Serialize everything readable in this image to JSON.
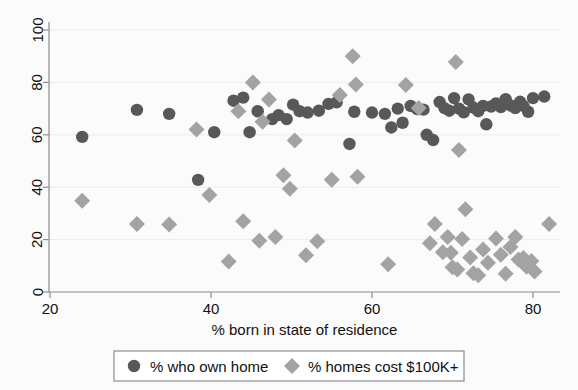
{
  "chart_data": {
    "type": "scatter",
    "title": "",
    "subtitle": "",
    "xlabel": "% born in state of residence",
    "ylabel": "",
    "xlim": [
      20,
      82
    ],
    "ylim": [
      0,
      105
    ],
    "xticks": [
      20,
      40,
      60,
      80
    ],
    "yticks": [
      0,
      20,
      40,
      60,
      80,
      100
    ],
    "xtick_labels": [
      "20",
      "40",
      "60",
      "80"
    ],
    "ytick_labels": [
      "0",
      "20",
      "40",
      "60",
      "80",
      "100"
    ],
    "grid": "horizontal-light",
    "legend_position": "bottom-outside",
    "colors": {
      "own_home": "#585858",
      "homes_100k": "#a3a3a3",
      "axis": "#8c8c8c",
      "grid": "#ececec",
      "background": "#fbfbfb",
      "text": "#111111"
    },
    "series": [
      {
        "name": "% who own home",
        "marker": "circle",
        "color": "#585858",
        "points": [
          [
            24.0,
            59.2
          ],
          [
            30.8,
            69.5
          ],
          [
            34.8,
            68.0
          ],
          [
            38.4,
            42.8
          ],
          [
            40.4,
            61.0
          ],
          [
            42.8,
            73.0
          ],
          [
            44.0,
            74.2
          ],
          [
            44.8,
            61.0
          ],
          [
            45.8,
            69.0
          ],
          [
            47.6,
            66.0
          ],
          [
            48.4,
            67.5
          ],
          [
            49.4,
            66.0
          ],
          [
            50.2,
            71.5
          ],
          [
            51.0,
            69.0
          ],
          [
            52.0,
            68.5
          ],
          [
            53.4,
            69.2
          ],
          [
            54.6,
            71.8
          ],
          [
            55.6,
            72.4
          ],
          [
            57.2,
            56.5
          ],
          [
            57.8,
            68.8
          ],
          [
            60.0,
            68.5
          ],
          [
            61.6,
            68.0
          ],
          [
            62.4,
            62.8
          ],
          [
            63.2,
            70.0
          ],
          [
            63.8,
            64.6
          ],
          [
            64.8,
            71.0
          ],
          [
            65.6,
            69.8
          ],
          [
            66.4,
            69.6
          ],
          [
            66.8,
            60.0
          ],
          [
            67.6,
            58.0
          ],
          [
            68.4,
            72.5
          ],
          [
            69.0,
            70.2
          ],
          [
            69.6,
            69.2
          ],
          [
            70.2,
            74.0
          ],
          [
            70.8,
            70.0
          ],
          [
            71.4,
            68.6
          ],
          [
            72.0,
            73.5
          ],
          [
            72.6,
            70.4
          ],
          [
            73.2,
            69.0
          ],
          [
            73.8,
            71.0
          ],
          [
            74.2,
            64.0
          ],
          [
            74.8,
            70.8
          ],
          [
            75.4,
            72.0
          ],
          [
            76.0,
            70.6
          ],
          [
            76.6,
            73.6
          ],
          [
            77.2,
            71.2
          ],
          [
            77.8,
            70.2
          ],
          [
            78.4,
            72.6
          ],
          [
            78.8,
            71.0
          ],
          [
            79.4,
            68.8
          ],
          [
            80.0,
            74.0
          ],
          [
            81.4,
            74.6
          ]
        ]
      },
      {
        "name": "% homes cost $100K+",
        "marker": "diamond",
        "color": "#a3a3a3",
        "points": [
          [
            24.0,
            34.8
          ],
          [
            30.8,
            26.0
          ],
          [
            34.8,
            25.8
          ],
          [
            38.2,
            62.0
          ],
          [
            39.8,
            37.0
          ],
          [
            42.2,
            11.6
          ],
          [
            43.4,
            69.0
          ],
          [
            44.0,
            27.0
          ],
          [
            45.2,
            80.0
          ],
          [
            46.0,
            19.6
          ],
          [
            46.4,
            65.0
          ],
          [
            47.2,
            73.5
          ],
          [
            48.0,
            21.0
          ],
          [
            49.0,
            44.6
          ],
          [
            49.8,
            39.4
          ],
          [
            50.4,
            57.8
          ],
          [
            51.8,
            14.0
          ],
          [
            53.2,
            19.4
          ],
          [
            55.0,
            42.8
          ],
          [
            56.0,
            75.2
          ],
          [
            57.6,
            90.0
          ],
          [
            58.0,
            79.2
          ],
          [
            58.2,
            44.0
          ],
          [
            62.0,
            10.6
          ],
          [
            64.2,
            79.0
          ],
          [
            65.8,
            70.2
          ],
          [
            67.2,
            18.6
          ],
          [
            67.8,
            26.0
          ],
          [
            68.8,
            15.2
          ],
          [
            69.4,
            21.0
          ],
          [
            69.8,
            15.0
          ],
          [
            70.0,
            9.4
          ],
          [
            70.4,
            87.8
          ],
          [
            70.6,
            8.6
          ],
          [
            70.8,
            54.2
          ],
          [
            71.2,
            20.2
          ],
          [
            71.6,
            31.6
          ],
          [
            72.2,
            13.2
          ],
          [
            72.6,
            7.2
          ],
          [
            73.2,
            6.4
          ],
          [
            73.8,
            16.2
          ],
          [
            74.4,
            11.2
          ],
          [
            75.4,
            20.4
          ],
          [
            76.0,
            14.2
          ],
          [
            76.6,
            7.0
          ],
          [
            77.2,
            17.2
          ],
          [
            77.8,
            21.0
          ],
          [
            78.2,
            12.4
          ],
          [
            78.8,
            13.0
          ],
          [
            79.2,
            9.6
          ],
          [
            79.8,
            11.8
          ],
          [
            80.2,
            7.8
          ],
          [
            82.0,
            26.0
          ]
        ]
      }
    ]
  },
  "legend": {
    "entries": [
      {
        "label": "% who own home",
        "marker": "circle-marker"
      },
      {
        "label": "% homes cost $100K+",
        "marker": "diamond-marker"
      }
    ]
  },
  "axis": {
    "x_title": "% born in state of residence"
  }
}
